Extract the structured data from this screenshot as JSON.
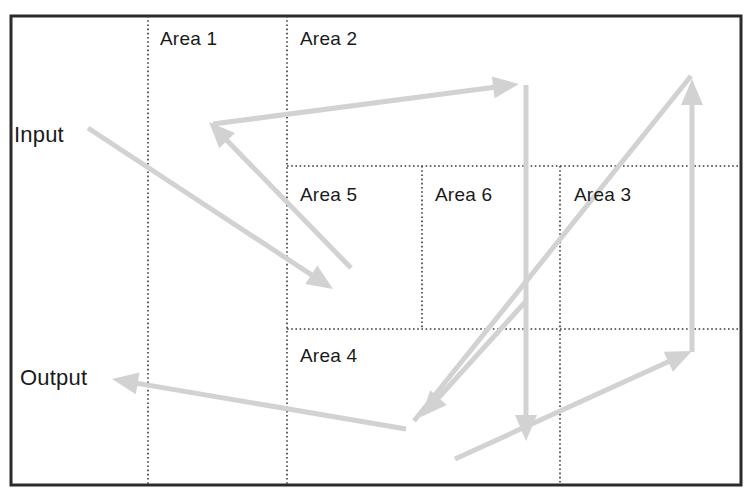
{
  "diagram": {
    "frame": {
      "x": 11,
      "y": 16,
      "width": 730,
      "height": 469,
      "border_color": "#2b2b2b",
      "border_width": 3
    },
    "background_color": "#ffffff",
    "divider_color": "#3a3a3a",
    "arrow_color": "#d2d2d2",
    "arrow_color_dark": "#c4c4c4",
    "labels": {
      "input": "Input",
      "output": "Output",
      "area1": "Area 1",
      "area2": "Area 2",
      "area3": "Area 3",
      "area4": "Area 4",
      "area5": "Area 5",
      "area6": "Area 6"
    },
    "label_positions": {
      "input": {
        "x": 14,
        "y": 122
      },
      "output": {
        "x": 20,
        "y": 365
      },
      "area1": {
        "x": 160,
        "y": 28
      },
      "area2": {
        "x": 300,
        "y": 28
      },
      "area5": {
        "x": 300,
        "y": 184
      },
      "area6": {
        "x": 435,
        "y": 184
      },
      "area3": {
        "x": 574,
        "y": 184
      },
      "area4": {
        "x": 300,
        "y": 345
      }
    },
    "dividers": [
      {
        "name": "vertical-area1-left",
        "orientation": "vertical",
        "x": 148,
        "y1": 16,
        "y2": 485
      },
      {
        "name": "vertical-area2-left",
        "orientation": "vertical",
        "x": 287,
        "y1": 16,
        "y2": 485
      },
      {
        "name": "vertical-area5-6",
        "orientation": "vertical",
        "x": 422,
        "y1": 166,
        "y2": 329
      },
      {
        "name": "vertical-area6-3",
        "orientation": "vertical",
        "x": 560,
        "y1": 166,
        "y2": 485
      },
      {
        "name": "horizontal-upper",
        "orientation": "horizontal",
        "y": 166,
        "x1": 287,
        "x2": 741
      },
      {
        "name": "horizontal-lower",
        "orientation": "horizontal",
        "y": 329,
        "x1": 287,
        "x2": 741
      }
    ],
    "arrows": [
      {
        "name": "input-to-area5",
        "from": {
          "x": 88,
          "y": 128
        },
        "to": {
          "x": 333,
          "y": 289
        },
        "head": "end"
      },
      {
        "name": "area5-to-area1",
        "from": {
          "x": 351,
          "y": 268
        },
        "to": {
          "x": 209,
          "y": 122
        },
        "head": "end"
      },
      {
        "name": "area1-to-area2-right",
        "from": {
          "x": 213,
          "y": 124
        },
        "to": {
          "x": 519,
          "y": 84
        },
        "head": "end"
      },
      {
        "name": "area2-down-to-area4",
        "from": {
          "x": 526,
          "y": 85
        },
        "to": {
          "x": 526,
          "y": 441
        },
        "head": "end"
      },
      {
        "name": "area4-up-to-area3",
        "from": {
          "x": 414,
          "y": 421
        },
        "to": {
          "x": 691,
          "y": 76
        },
        "head": "none"
      },
      {
        "name": "area3-vertical-up",
        "from": {
          "x": 692,
          "y": 352
        },
        "to": {
          "x": 692,
          "y": 79
        },
        "head": "end"
      },
      {
        "name": "bottom-to-area3",
        "from": {
          "x": 455,
          "y": 459
        },
        "to": {
          "x": 692,
          "y": 351
        },
        "head": "end"
      },
      {
        "name": "diagonal-to-area4",
        "from": {
          "x": 527,
          "y": 300
        },
        "to": {
          "x": 421,
          "y": 417
        },
        "head": "end"
      },
      {
        "name": "area4-to-output",
        "from": {
          "x": 406,
          "y": 429
        },
        "to": {
          "x": 112,
          "y": 379
        },
        "head": "end"
      }
    ]
  }
}
